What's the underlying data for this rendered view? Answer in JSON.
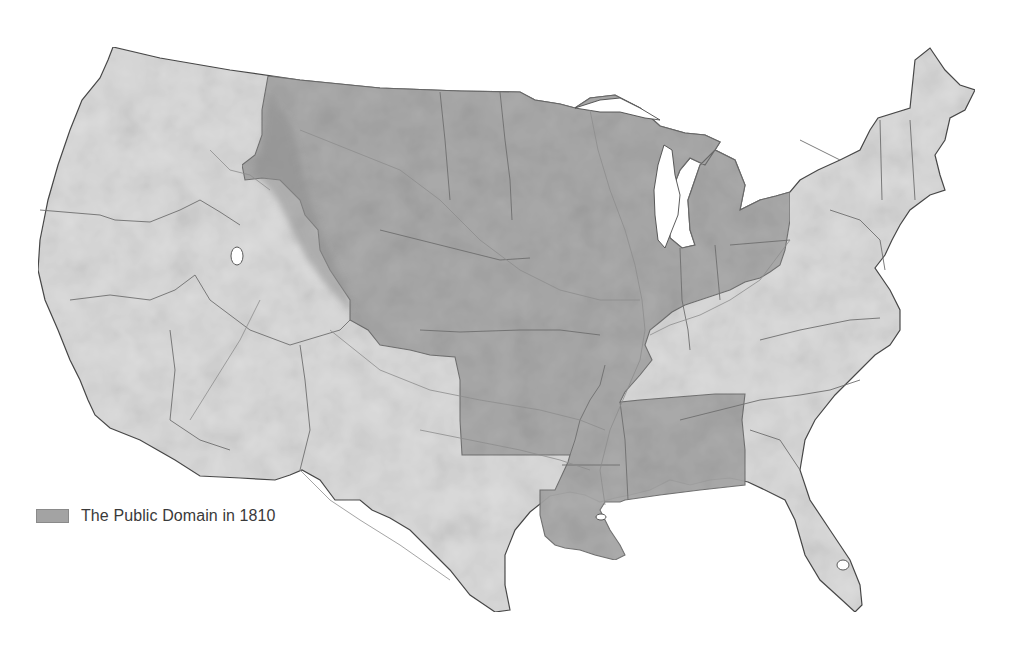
{
  "map": {
    "title": "The Public Domain in 1810",
    "region": "Contiguous United States",
    "colors": {
      "background": "#ffffff",
      "land": "#dcdcdc",
      "land_relief": "#cfcfcf",
      "public_domain": "#a9a9a9",
      "public_domain_edge": "#8e8e8e",
      "state_border": "#6e6e6e",
      "river": "#8d8d8d",
      "coast": "#4a4a4a",
      "lake": "#ffffff"
    }
  },
  "legend": {
    "items": [
      {
        "label": "The Public Domain in 1810",
        "swatch_color": "#a3a3a3"
      }
    ]
  }
}
